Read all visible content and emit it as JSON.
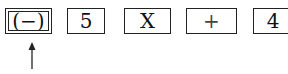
{
  "keys": [
    {
      "label": "(−)",
      "name": "negative-key"
    },
    {
      "label": "5",
      "name": "five-key"
    },
    {
      "label": "X",
      "name": "multiply-key"
    },
    {
      "label": "+",
      "name": "plus-key"
    },
    {
      "label": "4",
      "name": "four-key"
    }
  ],
  "indicator": {
    "points_to": "(−)",
    "direction": "up"
  },
  "colors": {
    "stroke": "#222222",
    "background": "#ffffff"
  }
}
